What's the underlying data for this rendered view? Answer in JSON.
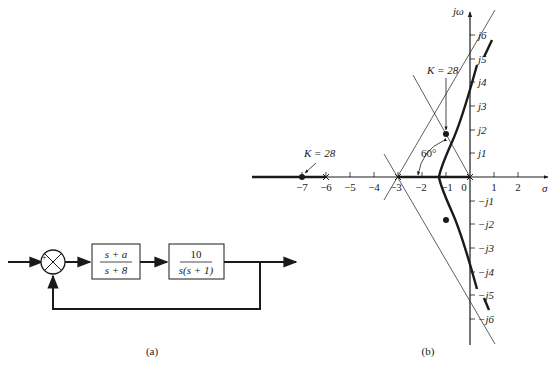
{
  "block_diagram": {
    "caption": "(a)",
    "summer": {
      "plus": "+",
      "minus": "−"
    },
    "compensator": {
      "num": "s + a",
      "den": "s + 8"
    },
    "plant": {
      "num": "10",
      "den": "s(s + 1)"
    }
  },
  "root_locus": {
    "caption": "(b)",
    "y_axis_label": "jω",
    "x_axis_label": "σ",
    "x_ticks": [
      "−7",
      "−6",
      "−5",
      "−4",
      "−3",
      "−2",
      "−1",
      "0",
      "1",
      "2"
    ],
    "y_ticks_pos": [
      "j1",
      "j2",
      "j3",
      "j4",
      "j5",
      "j6"
    ],
    "y_ticks_neg": [
      "−j1",
      "−j2",
      "−j3",
      "−j4",
      "−j5",
      "−j6"
    ],
    "annotations": {
      "k_real": "K = 28",
      "k_complex": "K = 28",
      "angle": "60°"
    }
  }
}
